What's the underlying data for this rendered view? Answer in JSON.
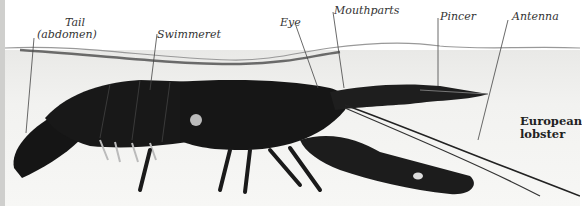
{
  "figure": {
    "title_line1": "European",
    "title_line2": "lobster",
    "labels": [
      {
        "id": "tail",
        "line1": "Tail",
        "line2": "(abdomen)"
      },
      {
        "id": "swimmeret",
        "line1": "Swimmeret"
      },
      {
        "id": "eye",
        "line1": "Eye"
      },
      {
        "id": "mouthparts",
        "line1": "Mouthparts"
      },
      {
        "id": "pincer",
        "line1": "Pincer"
      },
      {
        "id": "antenna",
        "line1": "Antenna"
      }
    ],
    "colors": {
      "lobster": "#141414",
      "water": "#efefed",
      "leader": "#444444"
    }
  }
}
